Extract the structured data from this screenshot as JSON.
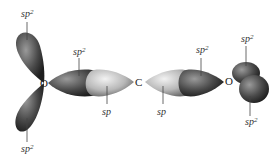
{
  "diagram": {
    "atoms": {
      "left_oxygen": "O",
      "carbon": "C",
      "right_oxygen": "O"
    },
    "labels": {
      "left_o_top": {
        "base": "sp",
        "sup": "2"
      },
      "left_o_bottom": {
        "base": "sp",
        "sup": "2"
      },
      "left_o_bond": {
        "base": "sp",
        "sup": "2"
      },
      "c_left_bond": {
        "base": "sp",
        "sup": ""
      },
      "c_right_bond": {
        "base": "sp",
        "sup": ""
      },
      "right_o_bond": {
        "base": "sp",
        "sup": "2"
      },
      "right_o_top": {
        "base": "sp",
        "sup": "2"
      },
      "right_o_bottom": {
        "base": "sp",
        "sup": "2"
      }
    },
    "colors": {
      "sp2_lobe": "#4a4a4a",
      "sp_lobe": "#b8b8b8"
    }
  }
}
